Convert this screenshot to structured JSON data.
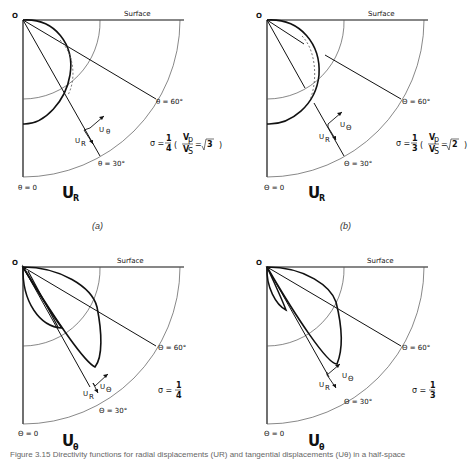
{
  "figure": {
    "caption": "Figure 3.15  Directivity functions for radial displacements (UR) and tangential displacements (Uθ) in a half-space",
    "panel_labels": [
      "(a)",
      "(b)"
    ]
  },
  "panels": [
    {
      "id": "a-top",
      "origin_label": "O",
      "surface_label": "Surface",
      "theta60_label": "θ = 60°",
      "theta30_label": "θ = 30°",
      "theta0_label": "θ = 0",
      "title_main": "U",
      "title_sub": "R",
      "ur_label": "U",
      "ur_sub": "R",
      "ut_label": "U",
      "ut_sub": "θ",
      "sigma_text": "σ = 1/4",
      "ratio_text": "Vp/Vs = √3"
    },
    {
      "id": "b-top",
      "origin_label": "O",
      "surface_label": "Surface",
      "theta60_label": "Θ = 60°",
      "theta30_label": "Θ = 30°",
      "theta0_label": "Θ = 0",
      "title_main": "U",
      "title_sub": "R",
      "ur_label": "U",
      "ur_sub": "R",
      "ut_label": "U",
      "ut_sub": "Θ",
      "sigma_text": "σ = 1/3",
      "ratio_text": "Vp/Vs = √2"
    },
    {
      "id": "a-bottom",
      "origin_label": "O",
      "surface_label": "Surface",
      "theta60_label": "Θ = 60°",
      "theta30_label": "Θ = 30°",
      "theta0_label": "Θ = 0",
      "title_main": "U",
      "title_sub": "θ",
      "ur_label": "U",
      "ur_sub": "R",
      "ut_label": "U",
      "ut_sub": "Θ",
      "sigma_text": "σ = 1/4"
    },
    {
      "id": "b-bottom",
      "origin_label": "O",
      "surface_label": "Surface",
      "theta60_label": "Θ = 60°",
      "theta30_label": "Θ = 30°",
      "theta0_label": "Θ = 0",
      "title_main": "U",
      "title_sub": "θ",
      "ur_label": "U",
      "ur_sub": "R",
      "ut_label": "U",
      "ut_sub": "Θ",
      "sigma_text": "σ = 1/3"
    }
  ],
  "sigma": {
    "a": {
      "num": "1",
      "den": "4",
      "vp": "V",
      "vp_sub": "p",
      "vs": "V",
      "vs_sub": "S",
      "root": "3"
    },
    "b": {
      "num": "1",
      "den": "3",
      "vp": "V",
      "vp_sub": "p",
      "vs": "V",
      "vs_sub": "S",
      "root": "2"
    }
  }
}
